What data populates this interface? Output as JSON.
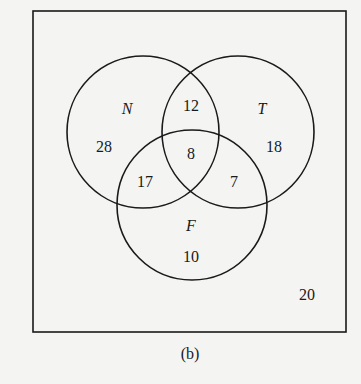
{
  "diagram": {
    "type": "venn",
    "caption": "(b)",
    "sets": [
      {
        "name": "N",
        "label": "N"
      },
      {
        "name": "T",
        "label": "T"
      },
      {
        "name": "F",
        "label": "F"
      }
    ],
    "regions": {
      "N_only": "28",
      "T_only": "18",
      "F_only": "10",
      "N_and_T_only": "12",
      "N_and_F_only": "17",
      "T_and_F_only": "7",
      "N_and_T_and_F": "8",
      "outside": "20"
    },
    "colors": {
      "stroke": "#1a1a1a",
      "background": "#f4f4f2"
    }
  }
}
